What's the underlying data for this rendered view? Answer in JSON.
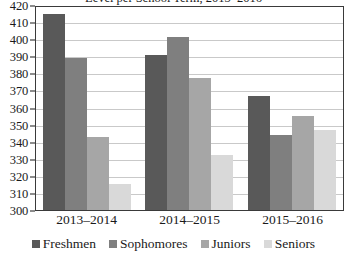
{
  "chart_data": {
    "type": "bar",
    "title": "Level per School Term, 2013–2016",
    "xlabel": "",
    "ylabel": "",
    "ylim": [
      300,
      420
    ],
    "ytick_step": 10,
    "yticks": [
      420,
      410,
      400,
      390,
      380,
      370,
      360,
      350,
      340,
      330,
      320,
      310,
      300
    ],
    "grid": true,
    "legend_position": "bottom",
    "categories": [
      "2013–2014",
      "2014–2015",
      "2015–2016"
    ],
    "series": [
      {
        "name": "Freshmen",
        "color": "#595959",
        "values": [
          415,
          391,
          367
        ]
      },
      {
        "name": "Sophomores",
        "color": "#7f7f7f",
        "values": [
          389,
          401,
          344
        ]
      },
      {
        "name": "Juniors",
        "color": "#a6a6a6",
        "values": [
          343,
          377,
          355
        ]
      },
      {
        "name": "Seniors",
        "color": "#d9d9d9",
        "values": [
          315,
          332,
          347
        ]
      }
    ]
  },
  "axis": {
    "y_tick_labels": [
      "420",
      "410",
      "400",
      "390",
      "380",
      "370",
      "360",
      "350",
      "340",
      "330",
      "320",
      "310",
      "300"
    ],
    "x_tick_labels": [
      "2013–2014",
      "2014–2015",
      "2015–2016"
    ]
  },
  "legend": {
    "items": [
      {
        "label": "Freshmen",
        "color": "#595959"
      },
      {
        "label": "Sophomores",
        "color": "#7f7f7f"
      },
      {
        "label": "Juniors",
        "color": "#a6a6a6"
      },
      {
        "label": "Seniors",
        "color": "#d9d9d9"
      }
    ]
  }
}
